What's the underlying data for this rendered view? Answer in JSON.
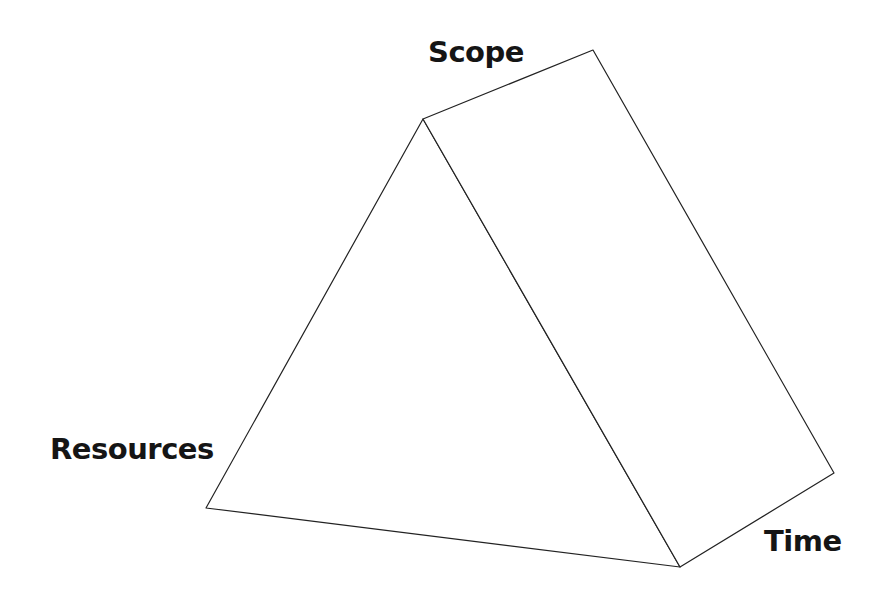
{
  "diagram": {
    "type": "triangular-prism",
    "labels": {
      "scope": "Scope",
      "resources": "Resources",
      "time": "Time"
    },
    "vertices": {
      "front_apex": [
        423,
        119
      ],
      "front_bottom_left": [
        206,
        508
      ],
      "front_bottom_right": [
        680,
        567
      ],
      "back_apex": [
        593,
        50
      ],
      "back_bottom_right": [
        834,
        473
      ]
    },
    "stroke_color": "#222222",
    "stroke_width": 1.2,
    "fill_color": "#ffffff"
  }
}
